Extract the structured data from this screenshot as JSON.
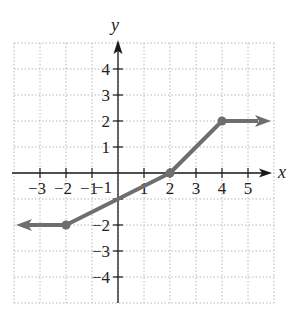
{
  "chart_data": {
    "type": "line",
    "title": "",
    "xlabel": "x",
    "ylabel": "y",
    "xlim": [
      -4,
      6
    ],
    "ylim": [
      -5,
      5
    ],
    "grid": true,
    "grid_style": "dotted",
    "x_ticks": [
      -3,
      -2,
      -1,
      1,
      2,
      3,
      4,
      5
    ],
    "y_ticks": [
      4,
      3,
      2,
      1,
      -2,
      -3,
      -4
    ],
    "x_tick_labels": [
      "−3",
      "−2",
      "−1",
      "1",
      "2",
      "3",
      "4",
      "5"
    ],
    "y_tick_labels": [
      "4",
      "3",
      "2",
      "1",
      "−2",
      "−3",
      "−4"
    ],
    "extra_labels": [
      {
        "text": "−1",
        "x": 0,
        "y": -1,
        "note": "y-axis tick -1 label overlaps line"
      }
    ],
    "series": [
      {
        "name": "piecewise function",
        "color": "#6e6e6e",
        "points": [
          [
            -2,
            -2
          ],
          [
            0,
            -1
          ],
          [
            2,
            0
          ],
          [
            4,
            2
          ]
        ],
        "left_ray": {
          "from": [
            -2,
            -2
          ],
          "direction": "left",
          "y": -2
        },
        "right_ray": {
          "from": [
            4,
            2
          ],
          "direction": "right",
          "y": 2
        },
        "closed_points": [
          [
            -2,
            -2
          ],
          [
            2,
            0
          ],
          [
            4,
            2
          ]
        ]
      }
    ],
    "legend": null
  },
  "colors": {
    "axis": "#1a1a1a",
    "grid": "#b8b8b8",
    "curve": "#6e6e6e"
  }
}
